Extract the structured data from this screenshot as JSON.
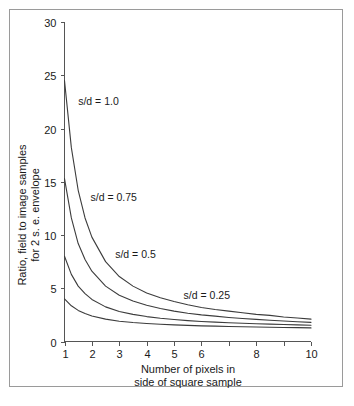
{
  "chart_data": {
    "type": "line",
    "title": "",
    "xlabel": "Number of pixels in side of square sample",
    "xlabel_line1": "Number of pixels in",
    "xlabel_line2": "side of square sample",
    "ylabel": "Ratio, field to image samples for 2 s. e. envelope",
    "ylabel_line1": "Ratio, field to image samples",
    "ylabel_line2": "for 2 s. e. envelope",
    "xlim": [
      1,
      10
    ],
    "ylim": [
      0,
      30
    ],
    "xticks": [
      1,
      2,
      3,
      4,
      5,
      6,
      7,
      8,
      9,
      10
    ],
    "xtick_labels": [
      "1",
      "2",
      "3",
      "4",
      "5",
      "6",
      "",
      "8",
      "",
      "10"
    ],
    "yticks": [
      0,
      5,
      10,
      15,
      20,
      25,
      30
    ],
    "ytick_labels": [
      "0",
      "5",
      "10",
      "15",
      "20",
      "25",
      "30"
    ],
    "grid": false,
    "legend_position": "inline-annotations",
    "x": [
      1,
      1.25,
      1.5,
      1.75,
      2,
      2.5,
      3,
      3.5,
      4,
      4.5,
      5,
      5.5,
      6,
      6.5,
      7,
      7.5,
      8,
      8.5,
      9,
      9.5,
      10
    ],
    "series": [
      {
        "name": "s/d = 1.0",
        "label": "s/d = 1.0",
        "color": "#3c3c3c",
        "annotation": {
          "x": 1.5,
          "y": 22.2
        },
        "values": [
          24.5,
          18.2,
          14.2,
          11.6,
          9.8,
          7.5,
          6.1,
          5.2,
          4.55,
          4.1,
          3.75,
          3.45,
          3.2,
          3.0,
          2.85,
          2.7,
          2.55,
          2.45,
          2.3,
          2.2,
          2.1
        ]
      },
      {
        "name": "s/d = 0.75",
        "label": "s/d = 0.75",
        "color": "#3c3c3c",
        "annotation": {
          "x": 1.95,
          "y": 13.2
        },
        "values": [
          15.3,
          11.6,
          9.2,
          7.7,
          6.6,
          5.2,
          4.35,
          3.8,
          3.4,
          3.1,
          2.85,
          2.65,
          2.5,
          2.38,
          2.26,
          2.16,
          2.08,
          2.0,
          1.92,
          1.85,
          1.8
        ]
      },
      {
        "name": "s/d = 0.5",
        "label": "s/d = 0.5",
        "color": "#3c3c3c",
        "annotation": {
          "x": 2.85,
          "y": 7.8
        },
        "values": [
          8.0,
          6.3,
          5.2,
          4.5,
          3.95,
          3.25,
          2.82,
          2.55,
          2.34,
          2.18,
          2.06,
          1.96,
          1.88,
          1.82,
          1.76,
          1.71,
          1.67,
          1.63,
          1.59,
          1.56,
          1.53
        ]
      },
      {
        "name": "s/d = 0.25",
        "label": "s/d = 0.25",
        "color": "#3c3c3c",
        "annotation": {
          "x": 5.35,
          "y": 4.0
        },
        "values": [
          4.0,
          3.35,
          2.92,
          2.62,
          2.4,
          2.1,
          1.9,
          1.78,
          1.69,
          1.62,
          1.56,
          1.51,
          1.47,
          1.44,
          1.41,
          1.38,
          1.36,
          1.34,
          1.32,
          1.3,
          1.28
        ]
      }
    ]
  }
}
